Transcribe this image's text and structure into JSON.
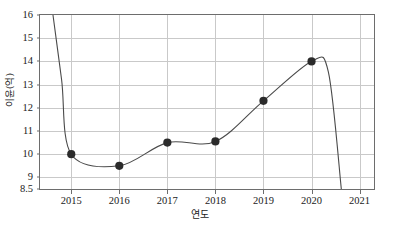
{
  "chart_data": {
    "type": "line",
    "title": "",
    "xlabel": "연도",
    "ylabel": "이윤(억)",
    "x": [
      2015,
      2016,
      2017,
      2018,
      2019,
      2020
    ],
    "values": [
      10.0,
      9.5,
      10.5,
      10.55,
      12.3,
      14.0
    ],
    "series": [
      {
        "name": "이윤",
        "values": [
          10.0,
          9.5,
          10.5,
          10.55,
          12.3,
          14.0
        ]
      }
    ],
    "xlim": [
      2014.35,
      2021.3
    ],
    "ylim": [
      8.5,
      16
    ],
    "xticks": [
      2015,
      2016,
      2017,
      2018,
      2019,
      2020,
      2021
    ],
    "xticklabels": [
      "2015",
      "2016",
      "2017",
      "2018",
      "2019",
      "2020",
      "2021"
    ],
    "yticks": [
      8.5,
      9,
      10,
      11,
      12,
      13,
      14,
      15,
      16
    ],
    "yticklabels": [
      "8.5",
      "9",
      "10",
      "11",
      "12",
      "13",
      "14",
      "15",
      "16"
    ],
    "grid": true,
    "legend": false,
    "marker": "filled-circle",
    "marker_color": "#2b2b2b",
    "line_color": "#4a4a4a",
    "grid_color": "#c9c9c9",
    "axis_color": "#6d6d6d",
    "curve_path": "M 63,14 C 70,60 78,104 88,126 C 98,148 108,163 118,163 C 129,163 140,152 151,144 C 162,136 172,133 183,133 C 194,133 205,134 215,132 C 226,130 236,120 247,108 C 258,96 268,78 279,68 C 290,58 300,55 311,61 C 322,67 332,100 343,140 C 350,162 356,178 361,190"
  },
  "caption": {
    "text": "",
    "visible": false
  }
}
